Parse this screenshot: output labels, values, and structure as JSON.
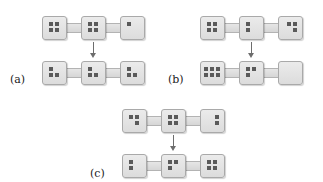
{
  "panels": [
    {
      "label": "(a)",
      "origin": [
        42,
        16
      ],
      "label_pos": [
        10,
        73
      ],
      "before": [
        4,
        4,
        1
      ],
      "after": [
        3,
        3,
        3
      ],
      "before_patterns": [
        "q4",
        "q4",
        "tl"
      ],
      "after_patterns": [
        "tri_tl",
        "tri_tl",
        "tri_tl"
      ]
    },
    {
      "label": "(b)",
      "origin": [
        200,
        16
      ],
      "label_pos": [
        168,
        73
      ],
      "before": [
        4,
        2,
        3
      ],
      "after": [
        6,
        3,
        0
      ],
      "before_patterns": [
        "q4",
        "col_left",
        "tri_tr"
      ],
      "after_patterns": [
        "six",
        "tri_bl",
        "none"
      ]
    },
    {
      "label": "(c)",
      "origin": [
        122,
        109
      ],
      "label_pos": [
        90,
        167
      ],
      "before": [
        3,
        4,
        2
      ],
      "after": [
        2,
        3,
        4
      ],
      "before_patterns": [
        "tri_br",
        "q4",
        "col_right"
      ],
      "after_patterns": [
        "col_left",
        "tri_bl",
        "q4"
      ]
    }
  ],
  "colors": {
    "box_fill": "#e4e4e4",
    "box_border": "#a9a9a9",
    "dot": "#5a5a5a",
    "arrow": "#6d6d6d"
  }
}
